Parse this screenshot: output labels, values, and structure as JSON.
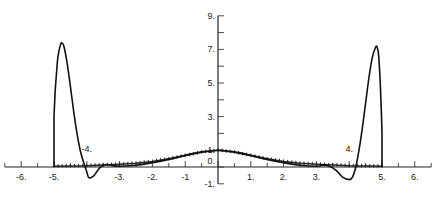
{
  "chart_data": {
    "type": "line",
    "title": "",
    "xlabel": "",
    "ylabel": "",
    "xlim": [
      -6.5,
      6.5
    ],
    "ylim": [
      -1,
      9
    ],
    "grid": false,
    "legend": null,
    "x_ticks": [
      "-6.",
      "-5.",
      "-4.",
      "-3.",
      "-2.",
      "-1",
      "1.",
      "2.",
      "3.",
      "4.",
      "5.",
      "6."
    ],
    "y_ticks": [
      "9.",
      "7.",
      "5.",
      "3.",
      "1.",
      "0.",
      "-1."
    ],
    "series": [
      {
        "name": "oscillating solution (solid)",
        "style": "solid",
        "x": [
          -5.0,
          -5.0,
          -4.9,
          -4.8,
          -4.75,
          -4.7,
          -4.6,
          -4.5,
          -4.4,
          -4.3,
          -4.2,
          -4.1,
          -4.0,
          -3.95,
          -3.9,
          -3.8,
          -3.7,
          -3.6,
          -3.5,
          -3.4,
          -3.3,
          -3.2,
          -3.0,
          -2.5,
          -2.0,
          -1.5,
          -1.0,
          -0.5,
          0.0,
          0.5,
          1.0,
          1.5,
          2.0,
          2.5,
          3.0,
          3.2,
          3.4,
          3.6,
          3.8,
          4.0,
          4.1,
          4.2,
          4.3,
          4.4,
          4.5,
          4.6,
          4.7,
          4.8,
          4.85,
          4.9,
          4.95,
          5.0,
          5.0
        ],
        "y": [
          0.0,
          3.0,
          6.2,
          7.3,
          7.35,
          7.2,
          6.2,
          4.8,
          3.3,
          2.0,
          1.0,
          0.3,
          -0.3,
          -0.6,
          -0.65,
          -0.55,
          -0.3,
          -0.05,
          0.1,
          0.15,
          0.12,
          0.08,
          0.05,
          0.1,
          0.25,
          0.45,
          0.7,
          0.9,
          1.0,
          0.9,
          0.7,
          0.45,
          0.25,
          0.1,
          0.05,
          0.1,
          0.05,
          -0.2,
          -0.6,
          -0.75,
          -0.6,
          0.0,
          1.0,
          2.3,
          3.8,
          5.3,
          6.5,
          7.1,
          7.15,
          6.6,
          4.8,
          2.0,
          0.0
        ]
      },
      {
        "name": "reference solution (dotted markers)",
        "style": "markers",
        "x": [
          -5.0,
          -4.5,
          -4.0,
          -3.5,
          -3.0,
          -2.5,
          -2.0,
          -1.5,
          -1.0,
          -0.5,
          0.0,
          0.5,
          1.0,
          1.5,
          2.0,
          2.5,
          3.0,
          3.5,
          4.0,
          4.5,
          5.0
        ],
        "y": [
          0.05,
          0.06,
          0.08,
          0.12,
          0.16,
          0.22,
          0.33,
          0.48,
          0.68,
          0.88,
          1.0,
          0.88,
          0.68,
          0.48,
          0.33,
          0.22,
          0.16,
          0.12,
          0.08,
          0.06,
          0.05
        ]
      }
    ],
    "annotations": [
      {
        "text": "-4.",
        "x": -4.0,
        "y": 0.9
      },
      {
        "text": "4.",
        "x": 4.0,
        "y": 0.9
      }
    ]
  },
  "axes": {
    "x_axis_labels": [
      "-6.",
      "-5.",
      "-3.",
      "-2.",
      "-1",
      "1.",
      "2.",
      "3.",
      "5.",
      "6."
    ],
    "y_axis_labels": [
      "9.",
      "7.",
      "5.",
      "3.",
      "1.",
      "0.",
      "-1."
    ],
    "inline_labels": [
      "-4.",
      "4."
    ]
  }
}
